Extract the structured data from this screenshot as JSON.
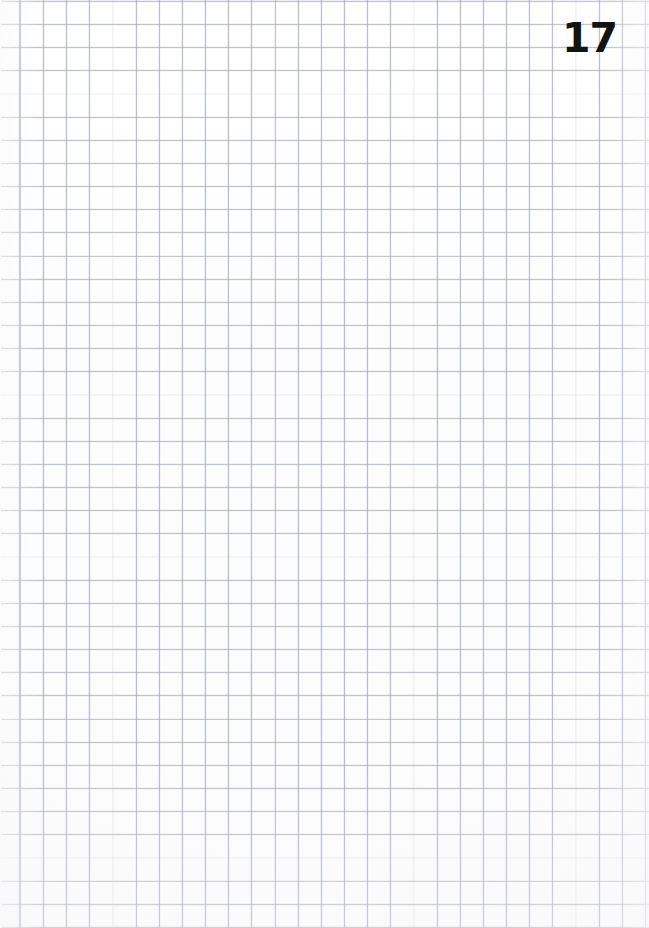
{
  "document": {
    "type": "grid-paper-page",
    "page_number": "17",
    "content_text": "",
    "is_blank": true,
    "paper": {
      "background_color": "#fefefe",
      "width_px": 649,
      "height_px": 928
    },
    "grid": {
      "style": "square-grid",
      "cell_size_px": 23.15,
      "line_color": "#96a0b2",
      "line_width_px": 0.9,
      "offset_x_px": 20,
      "offset_y_px": 1,
      "columns": 28,
      "rows": 40
    }
  }
}
